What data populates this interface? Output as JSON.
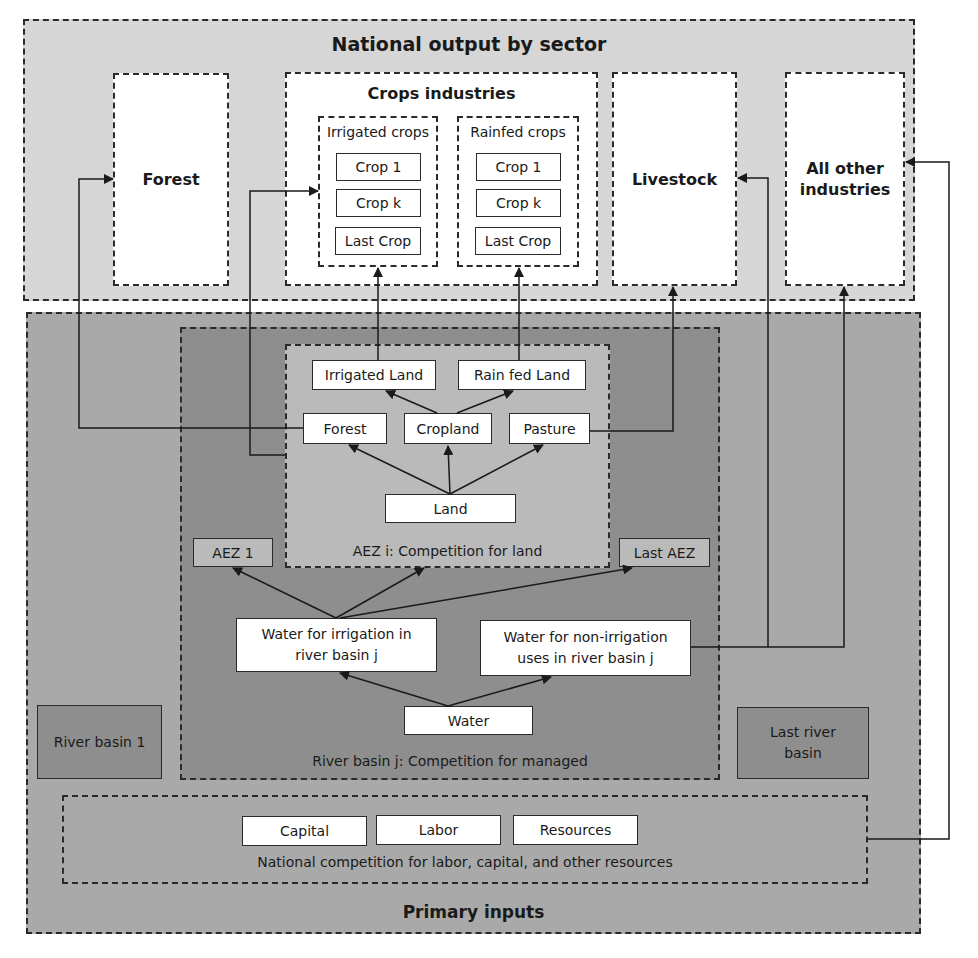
{
  "colors": {
    "output_panel": "#d6d6d6",
    "inputs_panel": "#a9a9a9",
    "river_basin_panel": "#8e8e8e",
    "aez_panel": "#bababa",
    "white_box": "#ffffff",
    "side_basin": "#8e8e8e",
    "line": "#1a1a1a"
  },
  "output": {
    "title": "National output by sector",
    "forest": "Forest",
    "crops": {
      "title": "Crops industries",
      "irrigated": {
        "title": "Irrigated crops",
        "items": [
          "Crop 1",
          "Crop k",
          "Last Crop"
        ]
      },
      "rainfed": {
        "title": "Rainfed crops",
        "items": [
          "Crop 1",
          "Crop k",
          "Last Crop"
        ]
      }
    },
    "livestock": "Livestock",
    "other": "All other industries"
  },
  "inputs": {
    "title": "Primary inputs",
    "river_basin_1": "River basin 1",
    "last_river_basin": "Last river basin",
    "river_basin_j": {
      "caption": "River basin j: Competition for  managed",
      "aez_1": "AEZ 1",
      "last_aez": "Last AEZ",
      "water_irrigation": "Water for irrigation in river basin j",
      "water_non_irrigation": "Water for non-irrigation uses in river basin j",
      "water": "Water",
      "aez_i": {
        "caption": "AEZ i: Competition for land",
        "irrigated_land": "Irrigated Land",
        "rainfed_land": "Rain fed Land",
        "forest": "Forest",
        "cropland": "Cropland",
        "pasture": "Pasture",
        "land": "Land"
      }
    },
    "national": {
      "caption": "National competition for labor, capital, and other resources",
      "capital": "Capital",
      "labor": "Labor",
      "resources": "Resources"
    }
  }
}
